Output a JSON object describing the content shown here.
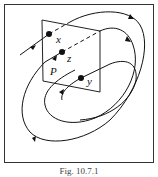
{
  "figure": {
    "caption": "Fig. 10.7.1",
    "plane_label": "P",
    "points": [
      {
        "label": "x",
        "cx": 49,
        "cy": 34
      },
      {
        "label": "z",
        "cx": 62,
        "cy": 52
      },
      {
        "label": "y",
        "cx": 81,
        "cy": 78
      }
    ],
    "colors": {
      "stroke": "#111111",
      "frame": "#333333",
      "background": "#ffffff"
    }
  }
}
